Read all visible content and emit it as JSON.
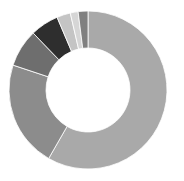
{
  "chart_data": {
    "type": "pie",
    "subtype": "donut",
    "title": "",
    "legend": null,
    "labels": [
      "Slice 1",
      "Slice 2",
      "Slice 3",
      "Slice 4",
      "Slice 5",
      "Slice 6",
      "Slice 7"
    ],
    "values": [
      58.3,
      21.8,
      7.7,
      5.8,
      2.8,
      1.6,
      2.0
    ],
    "colors": [
      "#a9a9a9",
      "#8c8c8c",
      "#6e6e6e",
      "#2e2e2e",
      "#c4c4c4",
      "#d6d6d6",
      "#808080"
    ],
    "start_angle_deg": 0,
    "direction": "clockwise",
    "center": [
      88,
      90
    ],
    "outer_radius": 79,
    "inner_radius": 42,
    "separator_color": "#ffffff"
  }
}
